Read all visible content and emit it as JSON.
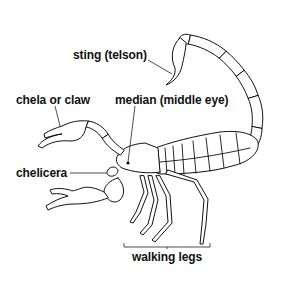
{
  "diagram": {
    "labels": {
      "sting": "sting (telson)",
      "chela": "chela or claw",
      "median_eye": "median (middle eye)",
      "chelicera": "chelicera",
      "walking_legs": "walking legs"
    }
  }
}
